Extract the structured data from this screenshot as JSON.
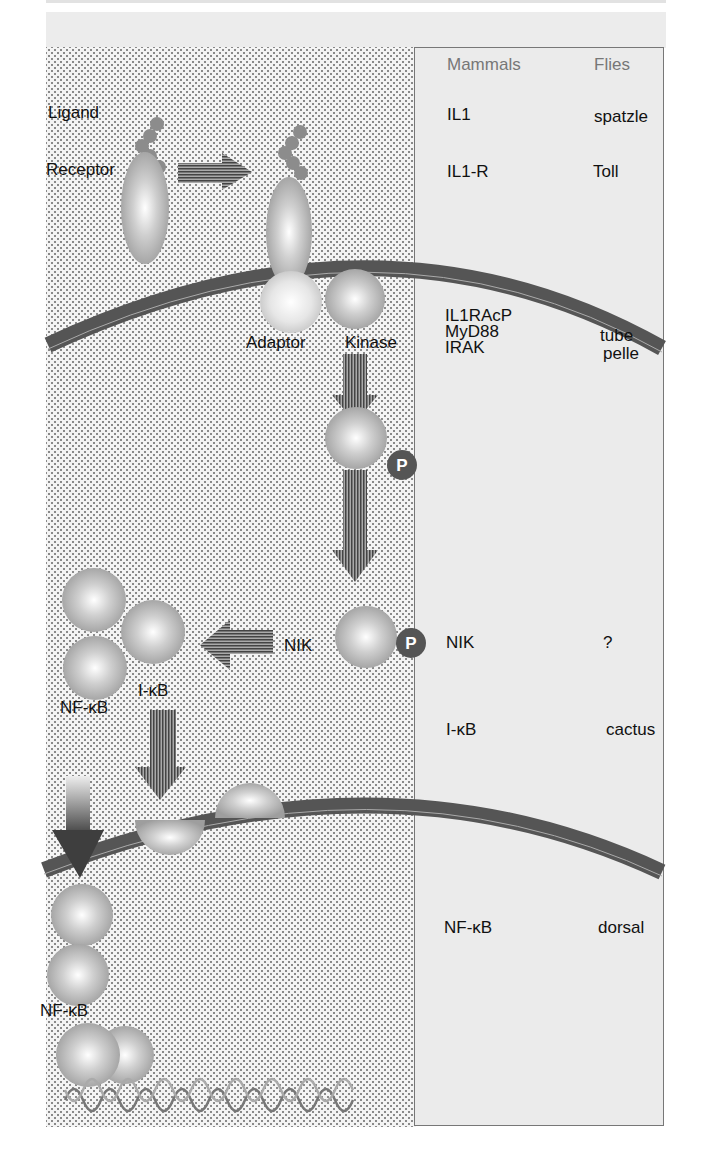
{
  "figure": {
    "labels": {
      "ligand": "Ligand",
      "receptor": "Receptor",
      "adaptor": "Adaptor",
      "kinase": "Kinase",
      "phospho_1": "P",
      "phospho_2": "P",
      "nik": "NIK",
      "ikb": "I-κB",
      "nfkb_complex": "NF-κB",
      "nfkb_nuclear": "NF-κB"
    },
    "colors": {
      "membrane": "#5a5a5a",
      "protein_fill": "#bdbdbd",
      "ligand_bead": "#8c8c8c",
      "phospho": "#555555",
      "panel_bg": "#ebebeb"
    }
  },
  "comparison_table": {
    "headers": {
      "mammals": "Mammals",
      "flies": "Flies"
    },
    "rows": [
      {
        "mammals": "IL1",
        "flies": "spatzle"
      },
      {
        "mammals": "IL1-R",
        "flies": "Toll"
      },
      {
        "mammals": "IL1RAcP\nMyD88\nIRAK",
        "flies": "\ntube\npelle"
      },
      {
        "mammals": "NIK",
        "flies": "?"
      },
      {
        "mammals": "I-κB",
        "flies": "cactus"
      },
      {
        "mammals": "NF-κB",
        "flies": "dorsal"
      }
    ],
    "row_parts": {
      "r3_m1": "IL1RAcP",
      "r3_m2": "MyD88",
      "r3_m3": "IRAK",
      "r3_f2": "tube",
      "r3_f3": "pelle"
    }
  }
}
